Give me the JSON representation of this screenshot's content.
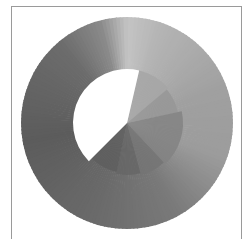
{
  "chart_data": {
    "type": "pie",
    "title": "",
    "xlabel": "",
    "ylabel": "",
    "legend": [],
    "grid": false,
    "center": [
      127,
      123
    ],
    "outer_disk": {
      "radius": 106,
      "gradient": "conic",
      "gradient_stops": [
        {
          "angle": 0,
          "color": "#c4c4c4"
        },
        {
          "angle": 20,
          "color": "#b4b4b4"
        },
        {
          "angle": 70,
          "color": "#a0a0a0"
        },
        {
          "angle": 110,
          "color": "#9c9c9c"
        },
        {
          "angle": 150,
          "color": "#7a7a7a"
        },
        {
          "angle": 200,
          "color": "#6a6a6a"
        },
        {
          "angle": 260,
          "color": "#5c5c5c"
        },
        {
          "angle": 320,
          "color": "#6c6c6c"
        },
        {
          "angle": 345,
          "color": "#8a8a8a"
        },
        {
          "angle": 360,
          "color": "#c4c4c4"
        }
      ]
    },
    "wedges": [
      {
        "start_deg": 13,
        "end_deg": 50,
        "radius": 54,
        "color": "#a6a6a6"
      },
      {
        "start_deg": 50,
        "end_deg": 78,
        "radius": 52,
        "color": "#969696"
      },
      {
        "start_deg": 78,
        "end_deg": 137,
        "radius": 56,
        "color": "#838383"
      },
      {
        "start_deg": 137,
        "end_deg": 165,
        "radius": 54,
        "color": "#747474"
      },
      {
        "start_deg": 165,
        "end_deg": 192,
        "radius": 52,
        "color": "#666666"
      },
      {
        "start_deg": 192,
        "end_deg": 225,
        "radius": 50,
        "color": "#5e5e5e"
      },
      {
        "start_deg": 225,
        "end_deg": 373,
        "radius": 54,
        "color": "#ffffff"
      }
    ],
    "angle_convention": "degrees clockwise from 12 o'clock"
  },
  "colors": {
    "frame": "#9a9a9a",
    "background": "#ffffff"
  }
}
